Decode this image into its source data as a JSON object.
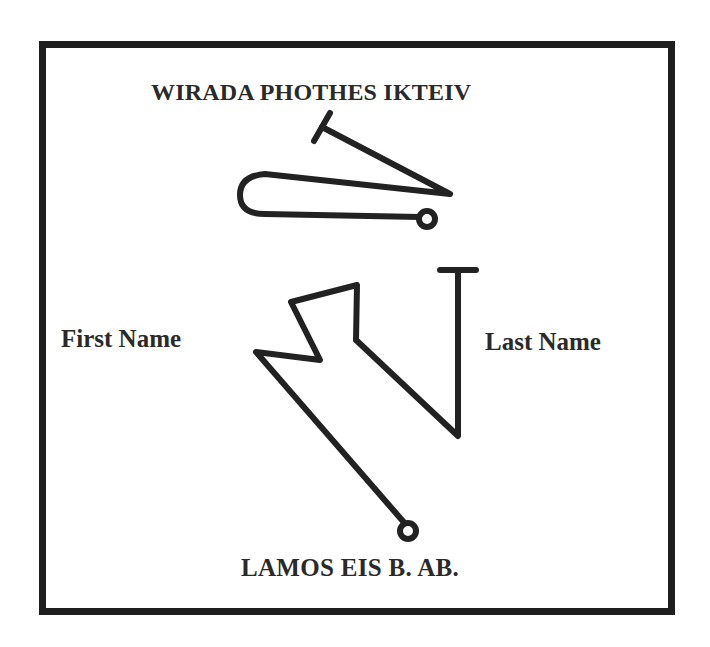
{
  "diagram": {
    "title": "WIRADA PHOTHES IKTEIV",
    "left_label": "First Name",
    "right_label": "Last Name",
    "bottom_caption": "LAMOS EIS B. AB.",
    "colors": {
      "ink": "#222222",
      "border": "#1e1e1e",
      "background": "#ffffff",
      "text": "#2a2a2a"
    },
    "strokes": {
      "upper_signature": {
        "t_bar": "M 314 141 L 330 113",
        "main_path": "M 322 127 L 450 194 L 265 174 Q 240 176 240 195 Q 240 214 265 214 L 420 217",
        "end_circle": {
          "cx": 427,
          "cy": 219,
          "r": 8
        }
      },
      "lower_signature": {
        "path_points": "408,527 256,352 320,360 291,302 357,285 356,340 458,436 458,272",
        "t_bar": "M 440 270 L 476 270",
        "end_circle": {
          "cx": 408,
          "cy": 531,
          "r": 8
        }
      }
    }
  }
}
